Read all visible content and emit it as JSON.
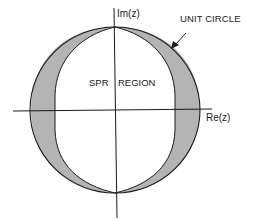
{
  "diagram": {
    "type": "complex-plane region diagram",
    "axes": {
      "imaginary_label": "Im(z)",
      "real_label": "Re(z)"
    },
    "annotations": {
      "unit_circle_label": "UNIT CIRCLE",
      "region_label_left": "SPR",
      "region_label_right": "REGION"
    },
    "shapes": {
      "unit_circle": {
        "cx": 115,
        "cy": 110,
        "rx": 85,
        "ry": 83
      },
      "shaded_regions": [
        "left crescent between unit circle and SPR boundary",
        "right crescent between unit circle and SPR boundary"
      ],
      "spr_region": "interior region bounded by curves touching unit circle at top and bottom"
    },
    "colors": {
      "line": "#1a1a1a",
      "shading": "#b4b4b4",
      "background": "#ffffff"
    }
  }
}
